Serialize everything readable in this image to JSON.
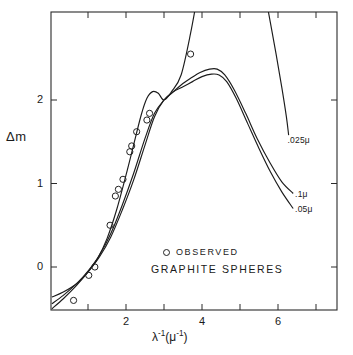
{
  "chart_data": {
    "type": "line",
    "title": "",
    "xlabel": "λ⁻¹(μ⁻¹)",
    "ylabel": "Δm",
    "xlim": [
      0,
      7.5
    ],
    "ylim": [
      -0.55,
      3.55
    ],
    "grid": false,
    "legend_position": "inside-lower-right",
    "xticks": [
      1,
      2,
      3,
      4,
      5,
      6,
      7
    ],
    "xticklabels": [
      "",
      "2",
      "",
      "4",
      "",
      "6",
      ""
    ],
    "yticks": [
      0,
      1,
      2
    ],
    "yticklabels": [
      "0",
      "1",
      "2"
    ],
    "legend": {
      "marker_symbol": "circle-open",
      "marker_label": "OBSERVED",
      "title": "GRAPHITE SPHERES"
    },
    "series": [
      {
        "name": ".025μ",
        "label": ".025μ",
        "label_x": 6.25,
        "label_y": 1.52,
        "style": "solid",
        "points": [
          [
            0.05,
            -0.36
          ],
          [
            0.35,
            -0.3
          ],
          [
            0.7,
            -0.2
          ],
          [
            1.0,
            -0.06
          ],
          [
            1.25,
            0.1
          ],
          [
            1.5,
            0.34
          ],
          [
            1.75,
            0.68
          ],
          [
            2.0,
            1.1
          ],
          [
            2.2,
            1.46
          ],
          [
            2.4,
            1.82
          ],
          [
            2.55,
            2.02
          ],
          [
            2.7,
            2.1
          ],
          [
            2.85,
            2.08
          ],
          [
            3.0,
            2.0
          ],
          [
            3.2,
            2.1
          ],
          [
            3.45,
            2.3
          ],
          [
            3.7,
            2.8
          ],
          [
            3.9,
            3.3
          ],
          [
            4.0,
            3.55
          ]
        ],
        "points_right": [
          [
            5.55,
            3.55
          ],
          [
            5.75,
            3.05
          ],
          [
            5.95,
            2.55
          ],
          [
            6.1,
            2.15
          ],
          [
            6.22,
            1.8
          ],
          [
            6.28,
            1.58
          ]
        ]
      },
      {
        "name": ".05μ",
        "label": ".05μ",
        "label_x": 6.45,
        "label_y": 0.7,
        "style": "solid",
        "points": [
          [
            0.05,
            -0.5
          ],
          [
            0.35,
            -0.38
          ],
          [
            0.7,
            -0.22
          ],
          [
            1.0,
            -0.06
          ],
          [
            1.3,
            0.12
          ],
          [
            1.6,
            0.36
          ],
          [
            1.9,
            0.68
          ],
          [
            2.2,
            1.04
          ],
          [
            2.5,
            1.46
          ],
          [
            2.75,
            1.8
          ],
          [
            3.0,
            2.0
          ],
          [
            3.25,
            2.1
          ],
          [
            3.5,
            2.16
          ],
          [
            3.75,
            2.22
          ],
          [
            4.0,
            2.28
          ],
          [
            4.25,
            2.31
          ],
          [
            4.45,
            2.3
          ],
          [
            4.65,
            2.22
          ],
          [
            4.9,
            2.02
          ],
          [
            5.2,
            1.72
          ],
          [
            5.5,
            1.42
          ],
          [
            5.8,
            1.14
          ],
          [
            6.1,
            0.9
          ],
          [
            6.4,
            0.7
          ]
        ]
      },
      {
        "name": ".1μ",
        "label": ".1μ",
        "label_x": 6.45,
        "label_y": 0.88,
        "style": "solid",
        "points": [
          [
            0.05,
            -0.44
          ],
          [
            0.35,
            -0.34
          ],
          [
            0.7,
            -0.2
          ],
          [
            1.0,
            -0.05
          ],
          [
            1.3,
            0.14
          ],
          [
            1.6,
            0.4
          ],
          [
            1.9,
            0.74
          ],
          [
            2.2,
            1.12
          ],
          [
            2.5,
            1.54
          ],
          [
            2.75,
            1.84
          ],
          [
            3.0,
            2.0
          ],
          [
            3.2,
            2.08
          ],
          [
            3.45,
            2.18
          ],
          [
            3.7,
            2.26
          ],
          [
            3.95,
            2.33
          ],
          [
            4.2,
            2.37
          ],
          [
            4.4,
            2.37
          ],
          [
            4.6,
            2.3
          ],
          [
            4.85,
            2.12
          ],
          [
            5.15,
            1.84
          ],
          [
            5.45,
            1.54
          ],
          [
            5.8,
            1.24
          ],
          [
            6.1,
            1.02
          ],
          [
            6.4,
            0.88
          ]
        ]
      }
    ],
    "observed": {
      "name": "OBSERVED",
      "marker": "circle-open",
      "values": [
        [
          0.62,
          -0.4
        ],
        [
          1.02,
          -0.1
        ],
        [
          1.18,
          0.0
        ],
        [
          1.58,
          0.5
        ],
        [
          1.72,
          0.85
        ],
        [
          1.8,
          0.93
        ],
        [
          1.92,
          1.05
        ],
        [
          2.1,
          1.38
        ],
        [
          2.15,
          1.45
        ],
        [
          2.28,
          1.62
        ],
        [
          2.55,
          1.76
        ],
        [
          2.62,
          1.84
        ],
        [
          3.7,
          2.55
        ]
      ]
    }
  }
}
